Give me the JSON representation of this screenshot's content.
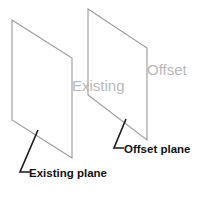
{
  "diagram": {
    "background_color": "#ffffff",
    "plane_stroke_color": "#9a9a9a",
    "leader_stroke_color": "#1a1a1a",
    "ghost_text_color": "#b9b9b9",
    "callout_text_color": "#121212",
    "ghost_labels": {
      "existing": "Existing",
      "offset": "Offset"
    },
    "callouts": {
      "existing_plane": "Existing plane",
      "offset_plane": "Offset plane"
    },
    "shapes": {
      "existing_plane_points": "12,20 72,58 72,158 12,120",
      "offset_plane_points": "88,9 147,48 147,140 88,95",
      "existing_leader_path": "M 38,130 L 20,172 L 30,172",
      "offset_leader_path": "M 126,119 L 114,148 L 124,148"
    }
  }
}
